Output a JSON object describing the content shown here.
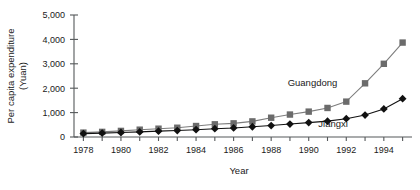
{
  "chart_data": {
    "type": "line",
    "title": "",
    "xlabel": "Year",
    "ylabel": "Per capita expenditure (Yuan)",
    "ylabel_line1": "Per capita expenditure",
    "ylabel_line2": "(Yuan)",
    "x": [
      1978,
      1979,
      1980,
      1981,
      1982,
      1983,
      1984,
      1985,
      1986,
      1987,
      1988,
      1989,
      1990,
      1991,
      1992,
      1993,
      1994,
      1995
    ],
    "xlim": [
      1977.5,
      1995.5
    ],
    "ylim": [
      0,
      5000
    ],
    "yticks": [
      0,
      1000,
      2000,
      3000,
      4000,
      5000
    ],
    "ytick_labels": [
      "0",
      "1,000",
      "2,000",
      "3,000",
      "4,000",
      "5,000"
    ],
    "xtick_labels": [
      "1978",
      "1980",
      "1982",
      "1984",
      "1986",
      "1988",
      "1990",
      "1992",
      "1994"
    ],
    "xtick_label_years": [
      1978,
      1980,
      1982,
      1984,
      1986,
      1988,
      1990,
      1992,
      1994
    ],
    "grid": false,
    "legend_position": "inline-annotation",
    "series": [
      {
        "name": "Guangdong",
        "marker": "square",
        "color": "#6b6b6b",
        "line_color": "#7d7d7d",
        "label_x": 1990.2,
        "label_y": 2080,
        "values": [
          180,
          210,
          250,
          300,
          340,
          380,
          450,
          520,
          560,
          640,
          790,
          920,
          1040,
          1190,
          1450,
          2200,
          3000,
          3870
        ]
      },
      {
        "name": "Jiangxi",
        "marker": "diamond",
        "color": "#111111",
        "line_color": "#111111",
        "label_x": 1991.3,
        "label_y": 430,
        "values": [
          140,
          160,
          185,
          210,
          240,
          265,
          300,
          340,
          370,
          420,
          470,
          530,
          590,
          650,
          750,
          900,
          1150,
          1570
        ]
      }
    ]
  }
}
